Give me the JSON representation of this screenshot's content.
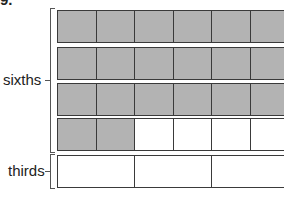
{
  "corner_label": "9.",
  "groups": [
    {
      "label": "sixths",
      "rows": [
        {
          "cells": [
            "shaded",
            "shaded",
            "shaded",
            "shaded",
            "shaded",
            "shaded"
          ]
        },
        {
          "cells": [
            "shaded",
            "shaded",
            "shaded",
            "shaded",
            "shaded",
            "shaded"
          ]
        },
        {
          "cells": [
            "shaded",
            "shaded",
            "shaded",
            "shaded",
            "shaded",
            "shaded"
          ]
        },
        {
          "cells": [
            "shaded",
            "shaded",
            "blank",
            "blank",
            "blank",
            "blank"
          ]
        }
      ]
    },
    {
      "label": "thirds",
      "rows": [
        {
          "cells": [
            "blank",
            "blank",
            "blank"
          ]
        }
      ]
    }
  ],
  "colors": {
    "shaded": "#b3b3b3",
    "blank": "#ffffff",
    "border": "#3a3a3a"
  }
}
